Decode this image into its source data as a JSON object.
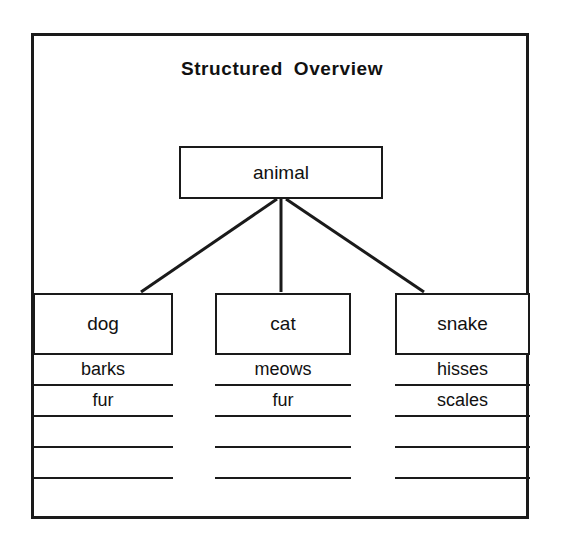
{
  "diagram": {
    "title": "Structured Overview",
    "root": {
      "label": "animal"
    },
    "columns": [
      {
        "id": "dog",
        "label": "dog",
        "attributes": [
          "barks",
          "fur",
          "",
          "",
          ""
        ]
      },
      {
        "id": "cat",
        "label": "cat",
        "attributes": [
          "meows",
          "fur",
          "",
          "",
          ""
        ]
      },
      {
        "id": "snake",
        "label": "snake",
        "attributes": [
          "hisses",
          "scales",
          "",
          "",
          ""
        ]
      }
    ],
    "colors": {
      "ink": "#1a1a1a",
      "text": "#111111",
      "background": "#ffffff"
    }
  }
}
